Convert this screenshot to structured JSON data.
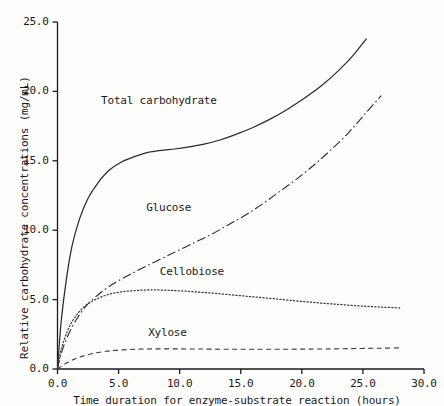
{
  "chart_data": {
    "type": "line",
    "title": "",
    "xlabel": "Time duration for enzyme-substrate reaction (hours)",
    "ylabel": "Relative carbohydrate concentrations (mg/mL)",
    "xlim": [
      0.0,
      30.0
    ],
    "ylim": [
      0.0,
      25.0
    ],
    "xticks": [
      "0.0",
      "5.0",
      "10.0",
      "15.0",
      "20.0",
      "25.0",
      "30.0"
    ],
    "xtick_values": [
      0.0,
      5.0,
      10.0,
      15.0,
      20.0,
      25.0,
      30.0
    ],
    "yticks": [
      "0.0",
      "5.0",
      "10.0",
      "15.0",
      "20.0",
      "25.0"
    ],
    "ytick_values": [
      0.0,
      5.0,
      10.0,
      15.0,
      20.0,
      25.0
    ],
    "grid": false,
    "legend": "inline-annotations",
    "series": [
      {
        "name": "Total carbohydrate",
        "style": "solid",
        "color": "#2b2b2b",
        "label_x": 8.3,
        "label_y": 19.3,
        "x": [
          0.0,
          0.3,
          0.7,
          1.2,
          1.8,
          2.5,
          3.3,
          4.2,
          5.2,
          6.3,
          7.4,
          8.5,
          9.6,
          10.8,
          12.0,
          13.3,
          14.6,
          16.0,
          17.4,
          18.8,
          20.2,
          21.6,
          23.0,
          24.2,
          25.3
        ],
        "y": [
          0.0,
          3.4,
          6.3,
          8.9,
          10.8,
          12.3,
          13.4,
          14.3,
          14.9,
          15.3,
          15.6,
          15.75,
          15.85,
          16.0,
          16.2,
          16.5,
          16.9,
          17.4,
          18.0,
          18.7,
          19.5,
          20.4,
          21.5,
          22.6,
          23.8
        ]
      },
      {
        "name": "Glucose",
        "style": "dashdot",
        "color": "#2b2b2b",
        "label_x": 9.1,
        "label_y": 11.6,
        "x": [
          0.0,
          0.3,
          0.8,
          1.5,
          2.4,
          3.4,
          4.5,
          5.7,
          7.0,
          8.4,
          9.8,
          11.2,
          12.6,
          14.0,
          15.4,
          16.8,
          18.2,
          19.6,
          21.0,
          22.4,
          23.8,
          25.1,
          26.5
        ],
        "y": [
          0.0,
          1.1,
          2.3,
          3.5,
          4.6,
          5.4,
          6.1,
          6.7,
          7.3,
          7.9,
          8.5,
          9.1,
          9.7,
          10.4,
          11.1,
          11.9,
          12.8,
          13.7,
          14.7,
          15.8,
          17.0,
          18.3,
          19.7
        ]
      },
      {
        "name": "Cellobiose",
        "style": "dotted",
        "color": "#3a3a3a",
        "label_x": 11.0,
        "label_y": 7.0,
        "x": [
          0.0,
          0.3,
          0.8,
          1.4,
          2.2,
          3.1,
          4.1,
          5.2,
          6.4,
          7.6,
          8.9,
          10.2,
          11.6,
          13.0,
          14.5,
          16.0,
          17.5,
          19.0,
          20.5,
          22.0,
          23.5,
          25.0,
          26.5,
          28.0
        ],
        "y": [
          0.0,
          1.4,
          2.7,
          3.7,
          4.5,
          5.0,
          5.35,
          5.55,
          5.65,
          5.7,
          5.68,
          5.62,
          5.54,
          5.44,
          5.32,
          5.2,
          5.08,
          4.95,
          4.83,
          4.72,
          4.62,
          4.53,
          4.46,
          4.4
        ]
      },
      {
        "name": "Xylose",
        "style": "dashed",
        "color": "#3a3a3a",
        "label_x": 9.0,
        "label_y": 2.6,
        "x": [
          0.0,
          0.4,
          1.0,
          1.8,
          2.8,
          4.0,
          5.3,
          6.7,
          8.2,
          9.8,
          11.4,
          13.0,
          14.7,
          16.4,
          18.1,
          19.8,
          21.5,
          23.2,
          24.9,
          26.5,
          28.0
        ],
        "y": [
          0.0,
          0.25,
          0.55,
          0.85,
          1.1,
          1.28,
          1.38,
          1.43,
          1.45,
          1.45,
          1.44,
          1.43,
          1.42,
          1.42,
          1.42,
          1.43,
          1.44,
          1.46,
          1.48,
          1.5,
          1.52
        ]
      }
    ]
  },
  "axes": {
    "axis_color": "#1a1a1a"
  }
}
